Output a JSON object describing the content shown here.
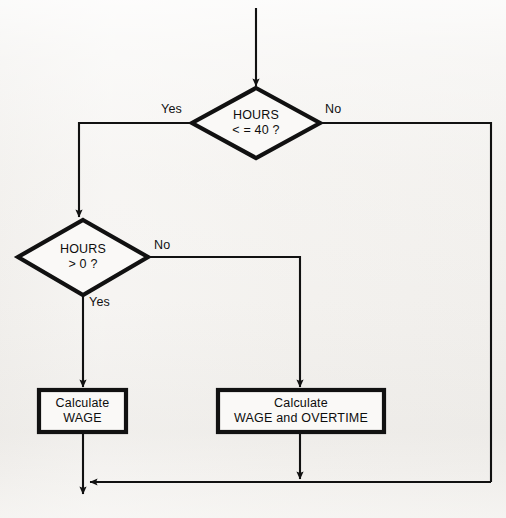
{
  "diagram": {
    "type": "flowchart",
    "colors": {
      "background": "#f3f1ee",
      "stroke": "#111111",
      "text": "#0d0d0d"
    },
    "entry": {
      "name": "entry-arrow"
    },
    "decisions": [
      {
        "id": "decision-hours-le-40",
        "line1": "HOURS",
        "line2": "< = 40 ?",
        "yes_label": "Yes",
        "no_label": "No",
        "center_x": 256,
        "center_y": 123
      },
      {
        "id": "decision-hours-gt-0",
        "line1": "HOURS",
        "line2": "> 0 ?",
        "yes_label": "Yes",
        "no_label": "No",
        "center_x": 83,
        "center_y": 257
      }
    ],
    "processes": [
      {
        "id": "process-calculate-wage",
        "line1": "Calculate",
        "line2": "WAGE",
        "x": 39,
        "y": 390,
        "width": 87,
        "height": 42
      },
      {
        "id": "process-calculate-wage-overtime",
        "line1": "Calculate",
        "line2": "WAGE and OVERTIME",
        "x": 218,
        "y": 390,
        "width": 166,
        "height": 42
      }
    ],
    "branch_labels": {
      "d1_yes": "Yes",
      "d1_no": "No",
      "d2_yes": "Yes",
      "d2_no": "No"
    },
    "exit": {
      "name": "exit-arrow"
    }
  }
}
